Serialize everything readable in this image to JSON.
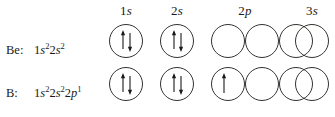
{
  "diagram": {
    "type": "orbital-filling-diagram",
    "background_color": "#ffffff",
    "stroke_color": "#33332f"
  },
  "columns": [
    {
      "id": "1s",
      "level": "1",
      "orbital": "s",
      "count": 1
    },
    {
      "id": "2s",
      "level": "2",
      "orbital": "s",
      "count": 1
    },
    {
      "id": "2p",
      "level": "2",
      "orbital": "p",
      "count": 3
    },
    {
      "id": "3s",
      "level": "3",
      "orbital": "s",
      "count": 1
    }
  ],
  "rows": [
    {
      "element": "Be:",
      "element_name": "Be",
      "config_prefix": "1",
      "config": [
        {
          "level": "1",
          "orbital": "s",
          "electrons": "2"
        },
        {
          "level": "2",
          "orbital": "s",
          "electrons": "2"
        }
      ],
      "config_text": "1s22s2",
      "orbitals": {
        "1s": [
          "up-down"
        ],
        "2s": [
          "up-down"
        ],
        "2p": [
          "empty",
          "empty",
          "empty"
        ],
        "3s": [
          "empty"
        ]
      }
    },
    {
      "element": "B:",
      "element_name": "B",
      "config_prefix": "1",
      "config": [
        {
          "level": "1",
          "orbital": "s",
          "electrons": "2"
        },
        {
          "level": "2",
          "orbital": "s",
          "electrons": "2"
        },
        {
          "level": "2",
          "orbital": "p",
          "electrons": "1"
        }
      ],
      "config_text": "1s22s22p1",
      "orbitals": {
        "1s": [
          "up-down"
        ],
        "2s": [
          "up-down"
        ],
        "2p": [
          "up",
          "empty",
          "empty"
        ],
        "3s": [
          "empty"
        ]
      }
    }
  ],
  "labels": {
    "header_1s_level": "1",
    "header_1s_orb": "s",
    "header_2s_level": "2",
    "header_2s_orb": "s",
    "header_2p_level": "2",
    "header_2p_orb": "p",
    "header_3s_level": "3",
    "header_3s_orb": "s",
    "row0_symbol": "Be:",
    "row1_symbol": "B:",
    "n1": "1",
    "n2": "2",
    "n3": "2",
    "s_letter": "s",
    "p_letter": "p",
    "two": "2",
    "one": "1"
  }
}
